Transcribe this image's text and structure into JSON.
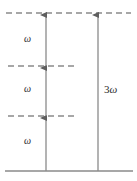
{
  "figure": {
    "kind": "energy-level-diagram",
    "width": 137,
    "height": 181,
    "background_color": "#ffffff",
    "line_color": "#8a8a8a",
    "arrow_color": "#6e6e6e",
    "text_color": "#2b2b2b"
  },
  "levels": [
    {
      "id": "final-level",
      "name": "final-state-level",
      "style": "dashed",
      "y": 13,
      "x_start": 6,
      "x_end": 131
    },
    {
      "id": "virtual-level-2",
      "name": "upper-virtual-level",
      "style": "dashed",
      "y": 66,
      "x_start": 8,
      "x_end": 78
    },
    {
      "id": "virtual-level-1",
      "name": "lower-virtual-level",
      "style": "dashed",
      "y": 116,
      "x_start": 8,
      "x_end": 78
    },
    {
      "id": "ground-level",
      "name": "ground-state-level",
      "style": "solid",
      "y": 171,
      "x_start": 5,
      "x_end": 133
    }
  ],
  "arrows": [
    {
      "id": "photon-1",
      "name": "photon-arrow-1",
      "x": 46,
      "y_from": 171,
      "y_to": 116,
      "direction": "up"
    },
    {
      "id": "photon-2",
      "name": "photon-arrow-2",
      "x": 46,
      "y_from": 116,
      "y_to": 66,
      "direction": "up"
    },
    {
      "id": "photon-3",
      "name": "photon-arrow-3",
      "x": 46,
      "y_from": 66,
      "y_to": 13,
      "direction": "up"
    },
    {
      "id": "harmonic",
      "name": "harmonic-arrow",
      "x": 98,
      "y_from": 171,
      "y_to": 13,
      "direction": "up"
    }
  ],
  "labels": {
    "omega_top": {
      "text": "ω",
      "x": 27,
      "y": 40
    },
    "omega_middle": {
      "text": "ω",
      "x": 27,
      "y": 90
    },
    "omega_bottom": {
      "text": "ω",
      "x": 27,
      "y": 142
    },
    "harmonic": {
      "number": "3",
      "symbol": "ω",
      "x": 106,
      "y": 90
    }
  }
}
